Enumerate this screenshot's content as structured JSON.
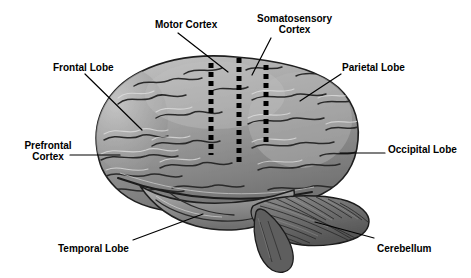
{
  "figure": {
    "background_color": "#ffffff",
    "ink_color": "#000000",
    "width": 471,
    "height": 278
  },
  "labels": {
    "motor_cortex": "Motor Cortex",
    "somatosensory_cortex": "Somatosensory\nCortex",
    "frontal_lobe": "Frontal Lobe",
    "parietal_lobe": "Parietal Lobe",
    "prefrontal_cortex": "Prefrontal\nCortex",
    "occipital_lobe": "Occipital Lobe",
    "temporal_lobe": "Temporal Lobe",
    "cerebellum": "Cerebellum"
  },
  "markers": {
    "dotted_lines": [
      {
        "name": "precentral-sulcus-boundary",
        "x": 211,
        "y_top": 63,
        "y_bottom": 155
      },
      {
        "name": "central-sulcus-boundary",
        "x": 239,
        "y_top": 58,
        "y_bottom": 162
      },
      {
        "name": "postcentral-sulcus-boundary",
        "x": 266,
        "y_top": 65,
        "y_bottom": 142
      }
    ],
    "dot_size": 5,
    "dot_gap": 4,
    "dot_color": "#000000"
  },
  "leader_lines": [
    {
      "name": "motor-cortex-leader",
      "x1": 178,
      "y1": 33,
      "x2": 228,
      "y2": 72
    },
    {
      "name": "somatosensory-cortex-leader",
      "x1": 271,
      "y1": 38,
      "x2": 252,
      "y2": 75
    },
    {
      "name": "frontal-lobe-leader",
      "x1": 85,
      "y1": 74,
      "x2": 142,
      "y2": 130
    },
    {
      "name": "parietal-lobe-leader",
      "x1": 341,
      "y1": 74,
      "x2": 300,
      "y2": 101
    },
    {
      "name": "prefrontal-cortex-leader",
      "x1": 70,
      "y1": 155,
      "x2": 120,
      "y2": 155
    },
    {
      "name": "occipital-lobe-leader",
      "x1": 385,
      "y1": 153,
      "x2": 340,
      "y2": 153
    },
    {
      "name": "temporal-lobe-leader",
      "x1": 133,
      "y1": 240,
      "x2": 203,
      "y2": 214
    },
    {
      "name": "cerebellum-leader",
      "x1": 374,
      "y1": 238,
      "x2": 315,
      "y2": 222
    }
  ],
  "anatomy": {
    "cerebrum_fill": "#9a9a9a",
    "cerebrum_shadow": "#6e6e6e",
    "cerebrum_highlight": "#c3c3c3",
    "cerebellum_fill": "#6b6b6b",
    "cerebellum_stripe": "#3c3c3c",
    "brainstem_fill": "#5e5e5e",
    "outline": "#1c1c1c",
    "parts": [
      {
        "name": "cerebrum",
        "label": "Cerebral cortex"
      },
      {
        "name": "cerebellum",
        "label": "Cerebellum"
      },
      {
        "name": "brainstem",
        "label": "Brainstem"
      }
    ]
  }
}
